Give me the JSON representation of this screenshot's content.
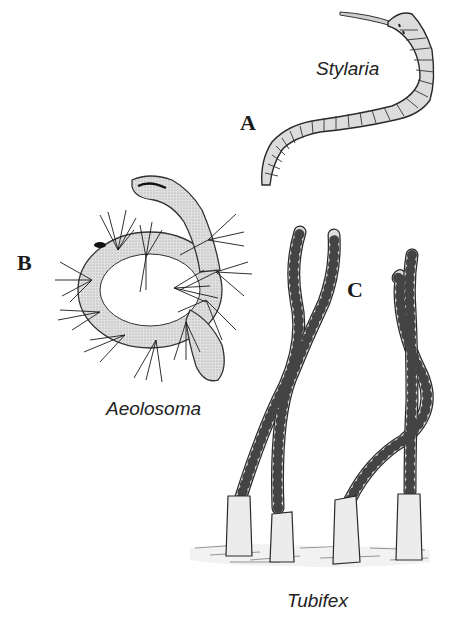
{
  "figure": {
    "panels": [
      {
        "letter": "A",
        "species": "Stylaria"
      },
      {
        "letter": "B",
        "species": "Aeolosoma"
      },
      {
        "letter": "C",
        "species": "Tubifex"
      }
    ]
  },
  "colors": {
    "body_fill": "#d9d9d9",
    "outline": "#2a2a2a",
    "tube_fill": "#e6e6e6",
    "setae": "#1a1a1a",
    "background": "#ffffff"
  }
}
